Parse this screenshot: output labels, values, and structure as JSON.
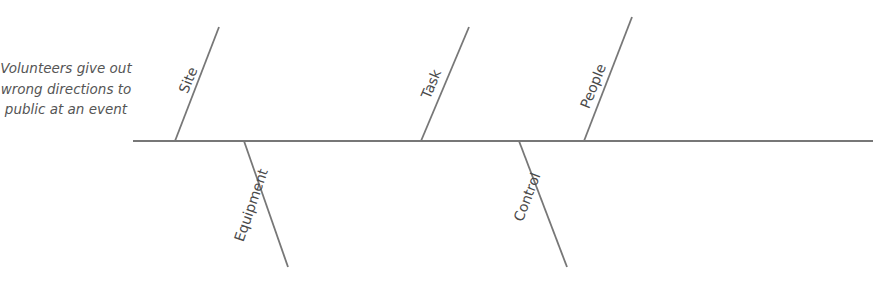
{
  "diagram": {
    "type": "fishbone",
    "effect": "Volunteers give out wrong directions to public at an event",
    "line_color": "#777777",
    "spine": {
      "x1": 133,
      "y1": 141,
      "x2": 873,
      "y2": 141
    },
    "bones": [
      {
        "label": "Site",
        "position": "top",
        "x1": 175,
        "y1": 141,
        "x2": 219,
        "y2": 27
      },
      {
        "label": "Equipment",
        "position": "bottom",
        "x1": 244,
        "y1": 141,
        "x2": 288,
        "y2": 267
      },
      {
        "label": "Task",
        "position": "top",
        "x1": 421,
        "y1": 141,
        "x2": 469,
        "y2": 27
      },
      {
        "label": "Control",
        "position": "bottom",
        "x1": 519,
        "y1": 141,
        "x2": 567,
        "y2": 267
      },
      {
        "label": "People",
        "position": "top",
        "x1": 584,
        "y1": 141,
        "x2": 632,
        "y2": 17
      }
    ]
  }
}
